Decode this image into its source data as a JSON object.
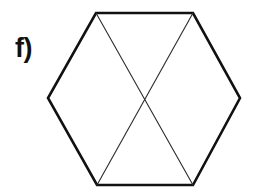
{
  "figure": {
    "label": "f)",
    "shape_name": "hexagon",
    "background_color": "#ffffff",
    "outline_color": "#111111",
    "outline_width": 2.6,
    "diagonal_color": "#2b2b2b",
    "diagonal_width": 1.1,
    "fill_color": "#ffffff",
    "orientation": "flat-top",
    "sides": 6,
    "vertices": [
      {
        "name": "top-left",
        "x": 96,
        "y": 13
      },
      {
        "name": "top-right",
        "x": 193,
        "y": 13
      },
      {
        "name": "right",
        "x": 240,
        "y": 98
      },
      {
        "name": "bottom-right",
        "x": 193,
        "y": 185
      },
      {
        "name": "bottom-left",
        "x": 97,
        "y": 185
      },
      {
        "name": "left",
        "x": 48,
        "y": 98
      }
    ],
    "diagonals": [
      {
        "name": "diagonal-top-left-to-bottom-right",
        "from": "top-left",
        "to": "bottom-right",
        "x1": 96,
        "y1": 13,
        "x2": 193,
        "y2": 185
      },
      {
        "name": "diagonal-top-right-to-bottom-left",
        "from": "top-right",
        "to": "bottom-left",
        "x1": 193,
        "y1": 13,
        "x2": 97,
        "y2": 185
      }
    ],
    "intersection": {
      "name": "center",
      "x": 145,
      "y": 99
    }
  }
}
